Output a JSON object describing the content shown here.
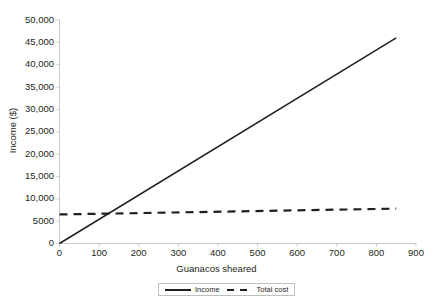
{
  "chart_data": {
    "type": "line",
    "title": "",
    "xlabel": "Guanacos sheared",
    "ylabel": "Income ($)",
    "xlim": [
      0,
      900
    ],
    "ylim": [
      0,
      50000
    ],
    "grid": false,
    "legend_position": "bottom-center",
    "x_ticks": [
      0,
      100,
      200,
      300,
      400,
      500,
      600,
      700,
      800,
      900
    ],
    "x_tick_labels": [
      "0",
      "100",
      "200",
      "300",
      "400",
      "500",
      "600",
      "700",
      "800",
      "900"
    ],
    "y_ticks": [
      0,
      5000,
      10000,
      15000,
      20000,
      25000,
      30000,
      35000,
      40000,
      45000,
      50000
    ],
    "y_tick_labels": [
      "0",
      "5000",
      "10,000",
      "15,000",
      "20,000",
      "25,000",
      "30,000",
      "35,000",
      "40,000",
      "45,000",
      "50,000"
    ],
    "series": [
      {
        "name": "Income",
        "style": "solid",
        "color": "#231f20",
        "x": [
          0,
          850
        ],
        "values": [
          0,
          46000
        ]
      },
      {
        "name": "Total cost",
        "style": "dashed",
        "color": "#231f20",
        "x": [
          0,
          850
        ],
        "values": [
          6500,
          7800
        ]
      }
    ],
    "break_even_point": {
      "x": 140,
      "y": 7500
    }
  },
  "legend": {
    "items": [
      {
        "label": "Income",
        "swatch": "solid"
      },
      {
        "label": "Total cost",
        "swatch": "dashed"
      }
    ]
  },
  "colors": {
    "line": "#231f20",
    "axis": "#c9c9c9",
    "legend_border": "#bfbfbf",
    "background": "#ffffff"
  }
}
